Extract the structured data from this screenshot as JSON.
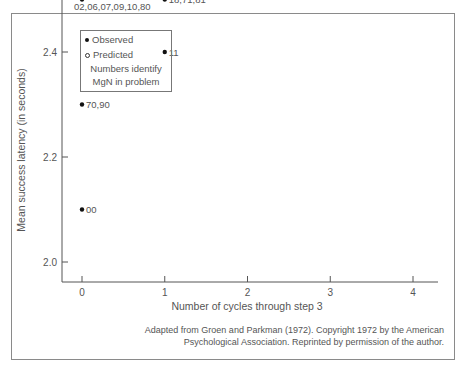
{
  "chart_data": {
    "type": "scatter",
    "title": "",
    "xlabel": "Number of cycles through step 3",
    "ylabel": "Mean success latency (in seconds)",
    "xlim": [
      0,
      4
    ],
    "ylim": [
      2.0,
      4.2
    ],
    "x_ticks": [
      "0",
      "1",
      "2",
      "3",
      "4"
    ],
    "y_ticks": [
      "2.0",
      "2.2",
      "2.4",
      "2.6",
      "2.8",
      "3.0",
      "3.2",
      "3.4",
      "3.6",
      "3.8",
      "4.0",
      "4.2"
    ],
    "grid": false,
    "legend": {
      "position": "upper-left",
      "entries": [
        "Observed",
        "Predicted"
      ],
      "note": [
        "Numbers identify",
        "MgN in problem"
      ]
    },
    "series": [
      {
        "name": "Observed",
        "marker": "filled-circle",
        "points": [
          {
            "x": 0,
            "y": 2.7,
            "label": "03,04,40,50"
          },
          {
            "x": 0,
            "y": 2.6,
            "label": "03,05,08,20,30,60"
          },
          {
            "x": 0,
            "y": 2.5,
            "label": "02,06,07,09,10,80"
          },
          {
            "x": 0,
            "y": 2.3,
            "label": "70,90"
          },
          {
            "x": 0,
            "y": 2.1,
            "label": "00"
          },
          {
            "x": 1,
            "y": 3.1,
            "label": "13"
          },
          {
            "x": 1,
            "y": 3.0,
            "label": "12,14,31"
          },
          {
            "x": 1,
            "y": 2.9,
            "label": "21,51"
          },
          {
            "x": 1,
            "y": 2.8,
            "label": "15,16,17,61"
          },
          {
            "x": 1,
            "y": 2.7,
            "label": "41"
          },
          {
            "x": 1,
            "y": 2.5,
            "label": "18,71,81"
          },
          {
            "x": 1,
            "y": 2.4,
            "label": "11"
          },
          {
            "x": 2,
            "y": 3.9,
            "label": "26"
          },
          {
            "x": 2,
            "y": 3.7,
            "label": "24"
          },
          {
            "x": 2,
            "y": 3.6,
            "label": "25,42"
          },
          {
            "x": 2,
            "y": 3.5,
            "label": "62"
          },
          {
            "x": 2,
            "y": 3.4,
            "label": "27"
          },
          {
            "x": 2,
            "y": 3.3,
            "label": "72"
          },
          {
            "x": 2,
            "y": 3.2,
            "label": "23,32,52"
          },
          {
            "x": 2,
            "y": 2.8,
            "label": "22"
          },
          {
            "x": 3,
            "y": 4.1,
            "label": "34"
          },
          {
            "x": 3,
            "y": 4.0,
            "label": "36,23,63"
          },
          {
            "x": 3,
            "y": 3.7,
            "label": "35"
          },
          {
            "x": 3,
            "y": 3.6,
            "label": "53"
          },
          {
            "x": 3,
            "y": 2.8,
            "label": "33"
          },
          {
            "x": 4,
            "y": 3.7,
            "label": "45, 54"
          },
          {
            "x": 4,
            "y": 2.6,
            "label": "44"
          }
        ]
      },
      {
        "name": "Predicted",
        "marker": "open-circle",
        "line": true,
        "points": [
          {
            "x": 0,
            "y": 2.52
          },
          {
            "x": 1,
            "y": 2.87
          },
          {
            "x": 2,
            "y": 3.21
          },
          {
            "x": 3,
            "y": 3.56
          },
          {
            "x": 4,
            "y": 3.9
          }
        ]
      }
    ],
    "caption": "Adapted from Groen and Parkman (1972). Copyright 1972 by the American Psychological Association. Reprinted by permission of the author."
  },
  "legend": {
    "observed": "Observed",
    "predicted": "Predicted",
    "note1": "Numbers identify",
    "note2": "MgN in problem"
  },
  "axes": {
    "xlabel": "Number of cycles through step 3",
    "ylabel": "Mean success latency (in seconds)"
  },
  "caption": {
    "line1": "Adapted from Groen and Parkman (1972). Copyright 1972 by the American",
    "line2": "Psychological Association. Reprinted by permission of the author."
  }
}
